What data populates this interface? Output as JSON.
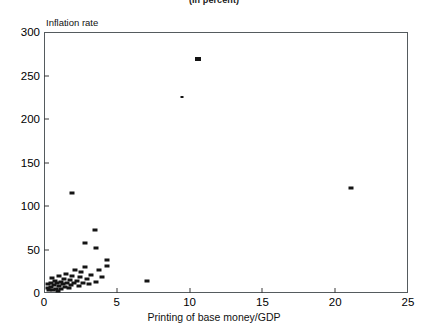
{
  "figure": {
    "subtitle": "(In percent)",
    "y_axis_title": "Inflation rate",
    "x_axis_title": "Printing of base money/GDP"
  },
  "chart_data": {
    "type": "scatter",
    "title": "",
    "subtitle": "(In percent)",
    "xlabel": "Printing of base money/GDP",
    "ylabel": "Inflation rate",
    "xlim": [
      0,
      25
    ],
    "ylim": [
      0,
      300
    ],
    "xticks": [
      0,
      5,
      10,
      15,
      20,
      25
    ],
    "yticks": [
      0,
      50,
      100,
      150,
      200,
      250,
      300
    ],
    "grid": false,
    "legend": null,
    "marker_color": "#141414",
    "points": [
      {
        "x": 0.25,
        "y": 6
      },
      {
        "x": 0.3,
        "y": 10
      },
      {
        "x": 0.35,
        "y": 3
      },
      {
        "x": 0.45,
        "y": 12
      },
      {
        "x": 0.5,
        "y": 7
      },
      {
        "x": 0.55,
        "y": 17
      },
      {
        "x": 0.6,
        "y": 4
      },
      {
        "x": 0.7,
        "y": 9
      },
      {
        "x": 0.75,
        "y": 14
      },
      {
        "x": 0.8,
        "y": 5
      },
      {
        "x": 0.9,
        "y": 11
      },
      {
        "x": 0.95,
        "y": 2
      },
      {
        "x": 1.0,
        "y": 19
      },
      {
        "x": 1.05,
        "y": 8
      },
      {
        "x": 1.15,
        "y": 13
      },
      {
        "x": 1.2,
        "y": 5
      },
      {
        "x": 1.3,
        "y": 10
      },
      {
        "x": 1.35,
        "y": 16
      },
      {
        "x": 1.45,
        "y": 7
      },
      {
        "x": 1.5,
        "y": 22
      },
      {
        "x": 1.6,
        "y": 12
      },
      {
        "x": 1.7,
        "y": 6
      },
      {
        "x": 1.8,
        "y": 15
      },
      {
        "x": 1.85,
        "y": 9
      },
      {
        "x": 1.95,
        "y": 20
      },
      {
        "x": 2.05,
        "y": 11
      },
      {
        "x": 2.15,
        "y": 27
      },
      {
        "x": 2.25,
        "y": 14
      },
      {
        "x": 2.4,
        "y": 8
      },
      {
        "x": 2.5,
        "y": 18
      },
      {
        "x": 2.55,
        "y": 24
      },
      {
        "x": 2.7,
        "y": 12
      },
      {
        "x": 2.85,
        "y": 30
      },
      {
        "x": 2.95,
        "y": 16
      },
      {
        "x": 3.1,
        "y": 10
      },
      {
        "x": 3.25,
        "y": 21
      },
      {
        "x": 3.55,
        "y": 13
      },
      {
        "x": 3.75,
        "y": 26
      },
      {
        "x": 4.0,
        "y": 18
      },
      {
        "x": 4.3,
        "y": 31
      },
      {
        "x": 1.9,
        "y": 115
      },
      {
        "x": 2.85,
        "y": 57
      },
      {
        "x": 3.5,
        "y": 72
      },
      {
        "x": 3.55,
        "y": 52
      },
      {
        "x": 4.35,
        "y": 38
      },
      {
        "x": 7.1,
        "y": 14
      },
      {
        "x": 9.5,
        "y": 225
      },
      {
        "x": 10.6,
        "y": 269
      },
      {
        "x": 21.1,
        "y": 121
      }
    ]
  }
}
